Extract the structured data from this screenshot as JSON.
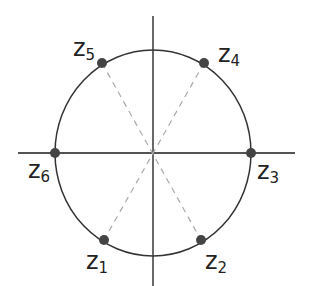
{
  "diagram": {
    "title": "",
    "colors": {
      "axis": "#1a1a1a",
      "circle": "#333333",
      "dash": "#aaaaaa",
      "point": "#444444"
    },
    "points": [
      {
        "id": "z1",
        "letter": "z",
        "sub": "1"
      },
      {
        "id": "z2",
        "letter": "z",
        "sub": "2"
      },
      {
        "id": "z3",
        "letter": "z",
        "sub": "3"
      },
      {
        "id": "z4",
        "letter": "z",
        "sub": "4"
      },
      {
        "id": "z5",
        "letter": "z",
        "sub": "5"
      },
      {
        "id": "z6",
        "letter": "z",
        "sub": "6"
      }
    ]
  }
}
